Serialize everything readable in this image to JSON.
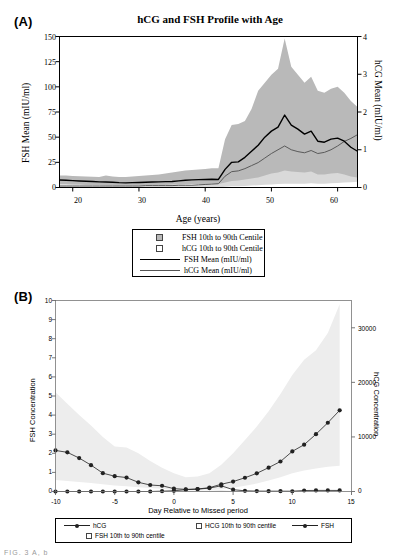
{
  "figure": {
    "panels": [
      "A",
      "B"
    ],
    "partial_caption": "FIG. 3  A, b"
  },
  "panelA": {
    "letter": "(A)",
    "title": "hCG and FSH Profile with Age",
    "y_left_label": "FSH Mean (mIU/ml)",
    "y_right_label": "hCG Mean (mIU/ml)",
    "x_label": "Age (years)",
    "y_left_ticks": [
      "0",
      "25",
      "50",
      "75",
      "100",
      "125",
      "150"
    ],
    "y_right_ticks": [
      "0",
      "1",
      "2",
      "3",
      "4"
    ],
    "x_ticks": [
      "20",
      "30",
      "40",
      "50",
      "60"
    ],
    "legend": [
      {
        "label": "FSH 10th to 90th Centile",
        "symbol": "filled-square-swatch"
      },
      {
        "label": "hCG 10th to 90th Centile",
        "symbol": "open-square-swatch"
      },
      {
        "label": "FSH Mean (mIU/ml)",
        "symbol": "thick-line-swatch"
      },
      {
        "label": "hCG Mean (mIU/ml)",
        "symbol": "thin-line-swatch"
      }
    ]
  },
  "panelB": {
    "letter": "(B)",
    "y_left_label": "FSH Concentration",
    "y_right_label": "hCG Concentration",
    "x_label": "Day Relative to Missed period",
    "y_left_ticks": [
      "0",
      "1",
      "2",
      "3",
      "4",
      "5",
      "6",
      "7",
      "8",
      "9",
      "10"
    ],
    "y_right_ticks": [
      "0",
      "10000",
      "20000",
      "30000"
    ],
    "x_ticks": [
      "-10",
      "-5",
      "0",
      "5",
      "10",
      "15"
    ],
    "legend": [
      {
        "label": "hCG",
        "symbol": "line-marker"
      },
      {
        "label": "HCG 10th to 90th centile",
        "symbol": "open-square-swatch"
      },
      {
        "label": "FSH",
        "symbol": "line-marker"
      },
      {
        "label": "FSH 10th to 90th centile",
        "symbol": "open-square-swatch"
      }
    ]
  },
  "colors": {
    "fsh_band": "#b9b9b9",
    "hcg_band": "#d9d9d9",
    "light_band": "#ededed",
    "fsh_line": "#000000",
    "hcg_line": "#5a5a5a",
    "marker": "#222222"
  },
  "chart_data": [
    {
      "type": "line",
      "panel": "A",
      "title": "hCG and FSH Profile with Age",
      "xlabel": "Age (years)",
      "ylabel": "FSH Mean (mIU/ml)",
      "y2label": "hCG Mean (mIU/ml)",
      "xlim": [
        18,
        63
      ],
      "ylim": [
        0,
        150
      ],
      "y2lim": [
        0,
        4
      ],
      "grid": false,
      "legend_position": "below-plot",
      "x": [
        18,
        19,
        20,
        21,
        22,
        23,
        24,
        25,
        26,
        27,
        28,
        29,
        30,
        31,
        32,
        33,
        34,
        35,
        36,
        37,
        38,
        39,
        40,
        41,
        42,
        43,
        44,
        45,
        46,
        47,
        48,
        49,
        50,
        51,
        52,
        53,
        54,
        55,
        56,
        57,
        58,
        59,
        60,
        61,
        62,
        63
      ],
      "series": [
        {
          "name": "FSH Mean (mIU/ml)",
          "axis": "left",
          "values": [
            7.5,
            7.2,
            6.8,
            6.5,
            6.2,
            6.0,
            5.6,
            5.4,
            5.2,
            4.8,
            4.6,
            4.8,
            5.0,
            5.2,
            5.4,
            5.6,
            5.8,
            6.0,
            6.6,
            7.2,
            7.6,
            7.8,
            8.0,
            8.2,
            8.0,
            18.0,
            25.0,
            25.5,
            30.0,
            36.0,
            42.0,
            50.0,
            56.0,
            60.0,
            72.0,
            62.0,
            58.0,
            53.0,
            56.0,
            46.0,
            45.0,
            48.0,
            49.0,
            46.0,
            40.0,
            36.0
          ]
        },
        {
          "name": "hCG Mean (mIU/ml)",
          "axis": "right",
          "values": [
            0.04,
            0.04,
            0.04,
            0.04,
            0.04,
            0.04,
            0.04,
            0.04,
            0.04,
            0.04,
            0.04,
            0.04,
            0.04,
            0.05,
            0.05,
            0.05,
            0.05,
            0.05,
            0.06,
            0.06,
            0.06,
            0.07,
            0.08,
            0.09,
            0.1,
            0.3,
            0.42,
            0.44,
            0.5,
            0.58,
            0.66,
            0.78,
            0.9,
            1.0,
            1.1,
            1.0,
            0.95,
            0.92,
            0.98,
            0.9,
            0.93,
            1.0,
            1.1,
            1.22,
            1.3,
            1.4
          ]
        },
        {
          "name": "FSH 10th to 90th Centile",
          "axis": "left",
          "type": "band",
          "lower": [
            3.0,
            3.0,
            2.8,
            2.7,
            2.6,
            2.5,
            2.4,
            2.3,
            2.2,
            2.1,
            2.0,
            2.1,
            2.2,
            2.3,
            2.4,
            2.5,
            2.6,
            2.7,
            3.0,
            3.2,
            3.4,
            3.5,
            3.6,
            3.7,
            3.6,
            5.0,
            6.5,
            7.0,
            8.0,
            9.0,
            10.0,
            12.0,
            14.0,
            15.0,
            17.0,
            16.0,
            15.5,
            15.0,
            16.0,
            13.0,
            13.0,
            14.0,
            14.5,
            13.0,
            11.0,
            10.0
          ],
          "upper": [
            12.0,
            11.8,
            11.5,
            11.2,
            11.0,
            10.8,
            10.5,
            12.0,
            11.0,
            10.5,
            10.5,
            11.0,
            11.5,
            12.0,
            12.5,
            13.0,
            14.0,
            15.0,
            16.0,
            17.0,
            17.5,
            18.0,
            18.5,
            19.0,
            19.0,
            48.0,
            62.0,
            63.0,
            66.0,
            78.0,
            96.0,
            104.0,
            112.0,
            118.0,
            148.0,
            120.0,
            112.0,
            104.0,
            110.0,
            96.0,
            94.0,
            98.0,
            100.0,
            94.0,
            86.0,
            80.0
          ]
        },
        {
          "name": "hCG 10th to 90th Centile",
          "axis": "right",
          "type": "band",
          "lower": [
            0.0,
            0.0,
            0.0,
            0.0,
            0.0,
            0.0,
            0.0,
            0.0,
            0.0,
            0.0,
            0.0,
            0.0,
            0.0,
            0.0,
            0.0,
            0.0,
            0.0,
            0.0,
            0.0,
            0.0,
            0.0,
            0.0,
            0.0,
            0.0,
            0.0,
            0.02,
            0.03,
            0.03,
            0.04,
            0.05,
            0.06,
            0.07,
            0.08,
            0.09,
            0.1,
            0.1,
            0.1,
            0.1,
            0.11,
            0.1,
            0.1,
            0.11,
            0.12,
            0.13,
            0.14,
            0.15
          ],
          "upper": [
            0.05,
            0.05,
            0.05,
            0.05,
            0.05,
            0.05,
            0.05,
            0.05,
            0.05,
            0.05,
            0.05,
            0.05,
            0.05,
            0.06,
            0.06,
            0.06,
            0.06,
            0.06,
            0.07,
            0.07,
            0.07,
            0.08,
            0.09,
            0.1,
            0.11,
            0.35,
            0.48,
            0.5,
            0.58,
            0.66,
            0.74,
            0.86,
            1.0,
            1.1,
            1.22,
            1.12,
            1.06,
            1.02,
            1.1,
            1.0,
            1.04,
            1.12,
            1.24,
            1.38,
            1.48,
            1.6
          ]
        }
      ]
    },
    {
      "type": "line",
      "panel": "B",
      "title": "",
      "xlabel": "Day Relative to Missed period",
      "ylabel": "FSH Concentration",
      "y2label": "hCG Concentration",
      "xlim": [
        -10,
        15
      ],
      "ylim": [
        0,
        10
      ],
      "y2lim": [
        0,
        35000
      ],
      "grid": false,
      "legend_position": "below-plot",
      "x": [
        -10,
        -9,
        -8,
        -7,
        -6,
        -5,
        -4,
        -3,
        -2,
        -1,
        0,
        1,
        2,
        3,
        4,
        5,
        6,
        7,
        8,
        9,
        10,
        11,
        12,
        13,
        14
      ],
      "series": [
        {
          "name": "FSH",
          "axis": "left",
          "values": [
            2.15,
            2.05,
            1.75,
            1.38,
            0.96,
            0.8,
            0.73,
            0.48,
            0.34,
            0.3,
            0.15,
            0.11,
            0.13,
            0.2,
            0.38,
            0.52,
            0.72,
            0.95,
            1.25,
            1.57,
            2.1,
            2.45,
            3.0,
            3.6,
            4.25
          ]
        },
        {
          "name": "hCG",
          "axis": "right",
          "values": [
            0,
            0,
            0,
            0,
            0,
            0,
            0,
            0,
            0,
            60,
            130,
            330,
            430,
            620,
            1050,
            330,
            130,
            70,
            60,
            55,
            50,
            180,
            200,
            200,
            190
          ]
        },
        {
          "name": "FSH 10th to 90th centile",
          "axis": "left",
          "type": "band",
          "lower": [
            0.6,
            0.55,
            0.5,
            0.45,
            0.38,
            0.32,
            0.28,
            0.22,
            0.18,
            0.14,
            0.08,
            0.05,
            0.05,
            0.07,
            0.12,
            0.2,
            0.3,
            0.42,
            0.58,
            0.75,
            0.95,
            1.1,
            1.2,
            1.3,
            1.35
          ],
          "upper": [
            5.2,
            4.6,
            4.0,
            3.45,
            2.85,
            2.35,
            2.3,
            2.0,
            1.6,
            1.25,
            0.95,
            0.75,
            0.78,
            0.95,
            1.4,
            2.0,
            2.7,
            3.4,
            4.2,
            5.1,
            6.1,
            6.9,
            7.4,
            8.3,
            9.8
          ]
        },
        {
          "name": "HCG 10th to 90th centile",
          "axis": "right",
          "type": "band",
          "lower": [
            0,
            0,
            0,
            0,
            0,
            0,
            0,
            0,
            0,
            0,
            0,
            0,
            0,
            0,
            0,
            0,
            0,
            0,
            0,
            0,
            0,
            0,
            0,
            0,
            0
          ],
          "upper": [
            0,
            0,
            0,
            0,
            0,
            0,
            0,
            0,
            0,
            0,
            20,
            60,
            90,
            140,
            260,
            90,
            30,
            20,
            15,
            15,
            15,
            40,
            50,
            50,
            45
          ]
        }
      ]
    }
  ]
}
